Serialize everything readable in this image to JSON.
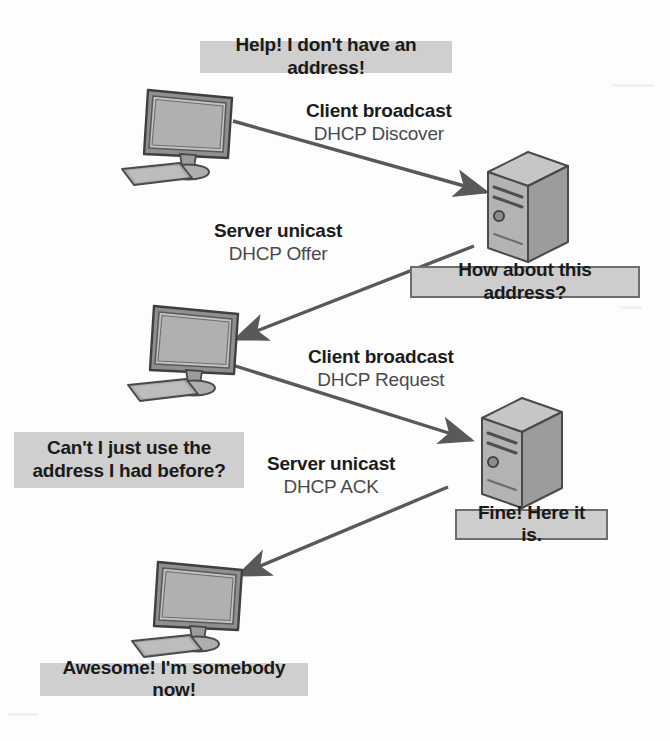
{
  "diagram": {
    "colors": {
      "callout_bg": "#cfcfcf",
      "callout_border": "#6d6d6d",
      "arrow": "#595959",
      "device_fill": "#b5b5b5",
      "device_stroke": "#4a4a4a",
      "label_primary": "#1c1c1c",
      "label_secondary": "#4a4a4a"
    },
    "callouts": [
      {
        "id": "client-no-address",
        "text": "Help! I don't have an address!",
        "bordered": false
      },
      {
        "id": "server-offer-address",
        "text": "How about this address?",
        "bordered": true
      },
      {
        "id": "client-reuse-address-line1",
        "text": "Can't I just use the",
        "bordered": false
      },
      {
        "id": "client-reuse-address-line2",
        "text": "address I had before?",
        "bordered": false
      },
      {
        "id": "server-fine-here-it-is",
        "text": "Fine! Here it is.",
        "bordered": true
      },
      {
        "id": "client-awesome",
        "text": "Awesome! I'm somebody now!",
        "bordered": false
      }
    ],
    "callout_text": {
      "client_no_address": "Help! I don't have an address!",
      "server_offer_address": "How about this address?",
      "client_reuse_address_1": "Can't I just use the",
      "client_reuse_address_2": "address I had before?",
      "server_fine_here_it_is": "Fine! Here it is.",
      "client_awesome": "Awesome! I'm somebody now!"
    },
    "messages": [
      {
        "id": "dhcp-discover",
        "direction": "Client broadcast",
        "packet": "DHCP Discover",
        "from": "client",
        "to": "server"
      },
      {
        "id": "dhcp-offer",
        "direction": "Server unicast",
        "packet": "DHCP Offer",
        "from": "server",
        "to": "client"
      },
      {
        "id": "dhcp-request",
        "direction": "Client broadcast",
        "packet": "DHCP Request",
        "from": "client",
        "to": "server"
      },
      {
        "id": "dhcp-ack",
        "direction": "Server unicast",
        "packet": "DHCP ACK",
        "from": "server",
        "to": "client"
      }
    ],
    "devices": [
      {
        "id": "client-1",
        "kind": "desktop-computer"
      },
      {
        "id": "server-1",
        "kind": "server-tower"
      },
      {
        "id": "client-2",
        "kind": "desktop-computer"
      },
      {
        "id": "server-2",
        "kind": "server-tower"
      },
      {
        "id": "client-3",
        "kind": "desktop-computer"
      }
    ]
  }
}
